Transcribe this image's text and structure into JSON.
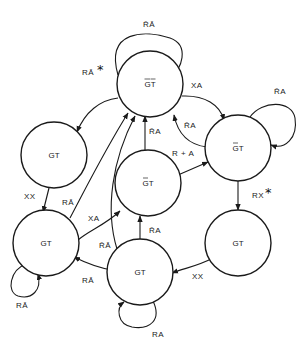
{
  "diagram": {
    "type": "state-transition",
    "nodes": [
      {
        "id": "top",
        "label": "GT",
        "bar_g": true,
        "bar_t": true
      },
      {
        "id": "right",
        "label": "GT",
        "tilde_g": true
      },
      {
        "id": "left_upper",
        "label": "GT"
      },
      {
        "id": "center",
        "label": "GT",
        "tilde_g": true
      },
      {
        "id": "left_lower",
        "label": "GT"
      },
      {
        "id": "bottom",
        "label": "GT"
      },
      {
        "id": "right_lower",
        "label": "GT"
      }
    ],
    "edges": [
      {
        "id": "top_loop",
        "from": "top",
        "to": "top",
        "label": "R̄Ā"
      },
      {
        "id": "top_to_left_upper",
        "from": "top",
        "to": "left_upper",
        "label": "RĀ",
        "starred": true
      },
      {
        "id": "top_to_right",
        "from": "top",
        "to": "right",
        "label": "XA"
      },
      {
        "id": "right_to_top",
        "from": "right",
        "to": "top",
        "label": "R̄A"
      },
      {
        "id": "right_loop",
        "from": "right",
        "to": "right",
        "label": "R̄A"
      },
      {
        "id": "right_to_right_lower",
        "from": "right",
        "to": "right_lower",
        "label": "RX",
        "starred": true
      },
      {
        "id": "center_to_right",
        "from": "center",
        "to": "right",
        "label": "R + A"
      },
      {
        "id": "center_to_top",
        "from": "center",
        "to": "top",
        "label": "R̄A"
      },
      {
        "id": "left_upper_to_left_lower",
        "from": "left_upper",
        "to": "left_lower",
        "label": "XX"
      },
      {
        "id": "left_lower_to_top",
        "from": "left_lower",
        "to": "top",
        "label": "RĀ"
      },
      {
        "id": "left_lower_to_center",
        "from": "left_lower",
        "to": "center",
        "label": "XA"
      },
      {
        "id": "bottom_to_top",
        "from": "bottom",
        "to": "top",
        "label": "R̄Ā"
      },
      {
        "id": "bottom_to_center",
        "from": "bottom",
        "to": "center",
        "label": "R̄A"
      },
      {
        "id": "bottom_to_left_lower",
        "from": "bottom",
        "to": "left_lower",
        "label": "RĀ"
      },
      {
        "id": "left_lower_loop",
        "from": "left_lower",
        "to": "left_lower",
        "label": "RĀ"
      },
      {
        "id": "bottom_loop",
        "from": "bottom",
        "to": "bottom",
        "label": "RA"
      },
      {
        "id": "right_lower_to_bottom",
        "from": "right_lower",
        "to": "bottom",
        "label": "XX"
      }
    ]
  }
}
